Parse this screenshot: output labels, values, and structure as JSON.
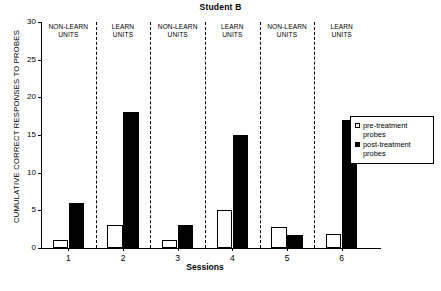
{
  "chart_data": {
    "type": "bar",
    "title": "Student B",
    "xlabel": "Sessions",
    "ylabel": "CUMULATIVE CORRECT RESPONSES TO PROBES",
    "categories": [
      "1",
      "2",
      "3",
      "4",
      "5",
      "6"
    ],
    "ylim": [
      0,
      30
    ],
    "yticks": [
      "0",
      "5",
      "10",
      "15",
      "20",
      "25",
      "30"
    ],
    "grid": false,
    "legend_position": "right",
    "series": [
      {
        "name": "pre-treatment probes",
        "color": "#ffffff",
        "values": [
          1,
          3,
          1,
          5,
          2.8,
          1.8
        ]
      },
      {
        "name": "post-treatment probes",
        "color": "#000000",
        "values": [
          6,
          18,
          3,
          15,
          1.7,
          17
        ]
      }
    ],
    "panels": [
      {
        "label": "NON-LEARN\nUNITS",
        "line1": "NON-LEARN",
        "line2": "UNITS",
        "session": "1"
      },
      {
        "label": "LEARN\nUNITS",
        "line1": "LEARN",
        "line2": "UNITS",
        "session": "2"
      },
      {
        "label": "NON-LEARN\nUNITS",
        "line1": "NON-LEARN",
        "line2": "UNITS",
        "session": "3"
      },
      {
        "label": "LEARN\nUNITS",
        "line1": "LEARN",
        "line2": "UNITS",
        "session": "4"
      },
      {
        "label": "NON-LEARN\nUNITS",
        "line1": "NON-LEARN",
        "line2": "UNITS",
        "session": "5"
      },
      {
        "label": "LEARN\nUNITS",
        "line1": "LEARN",
        "line2": "UNITS",
        "session": "6"
      }
    ]
  },
  "legend": {
    "items": [
      {
        "label_line1": "pre-treatment",
        "label_line2": "probes",
        "marker": "open-square"
      },
      {
        "label_line1": "post-treatment",
        "label_line2": "probes",
        "marker": "filled-square"
      }
    ]
  }
}
